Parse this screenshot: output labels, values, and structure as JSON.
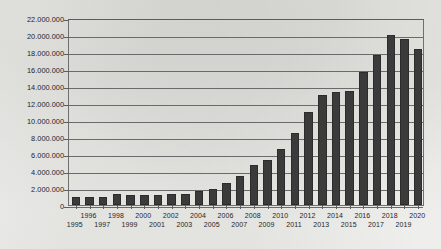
{
  "chart_data": {
    "type": "bar",
    "title": "",
    "subtitle": "",
    "xlabel": "",
    "ylabel": "",
    "grid": true,
    "legend": false,
    "legend_position": "none",
    "number_format": "european-dot-thousands",
    "bar_color": "#3b3b3b",
    "axis_color": "#6a6a6a",
    "background_color": "#f2f2f0",
    "ylim": [
      0,
      22000000
    ],
    "ytick_step": 2000000,
    "ytick_labels": [
      "0",
      "2.000.000",
      "4.000.000",
      "6.000.000",
      "8.000.000",
      "10.000.000",
      "12.000.000",
      "14.000.000",
      "16.000.000",
      "18.000.000",
      "20.000.000",
      "22.000.000"
    ],
    "ytick_values": [
      0,
      2000000,
      4000000,
      6000000,
      8000000,
      10000000,
      12000000,
      14000000,
      16000000,
      18000000,
      20000000,
      22000000
    ],
    "categories": [
      "1995",
      "1996",
      "1997",
      "1998",
      "1999",
      "2000",
      "2001",
      "2002",
      "2003",
      "2004",
      "2005",
      "2006",
      "2007",
      "2008",
      "2009",
      "2010",
      "2011",
      "2012",
      "2013",
      "2014",
      "2015",
      "2016",
      "2017",
      "2018",
      "2019",
      "2020"
    ],
    "values": [
      900000,
      1000000,
      900000,
      1300000,
      1200000,
      1200000,
      1200000,
      1300000,
      1300000,
      1600000,
      1900000,
      2600000,
      3400000,
      4700000,
      5300000,
      6600000,
      8500000,
      11000000,
      12900000,
      13300000,
      13400000,
      15600000,
      17700000,
      20000000,
      19500000,
      18400000
    ],
    "x_label_rows": {
      "top": [
        "1996",
        "1998",
        "2000",
        "2002",
        "2004",
        "2006",
        "2008",
        "2010",
        "2012",
        "2014",
        "2016",
        "2018",
        "2020"
      ],
      "bottom": [
        "1995",
        "1997",
        "1999",
        "2001",
        "2003",
        "2005",
        "2007",
        "2009",
        "2011",
        "2013",
        "2015",
        "2017",
        "2019"
      ]
    }
  }
}
